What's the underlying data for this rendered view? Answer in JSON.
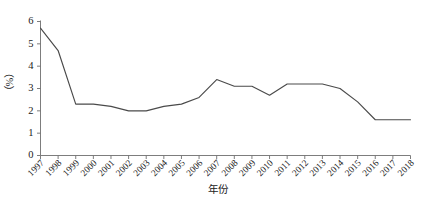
{
  "chart_data": {
    "type": "line",
    "title": "",
    "xlabel": "年份",
    "ylabel": "（%）",
    "categories": [
      "1997",
      "1998",
      "1999",
      "2000",
      "2001",
      "2002",
      "2003",
      "2004",
      "2005",
      "2006",
      "2007",
      "2008",
      "2009",
      "2010",
      "2011",
      "2012",
      "2013",
      "2014",
      "2015",
      "2016",
      "2017",
      "2018"
    ],
    "values": [
      5.7,
      4.7,
      2.3,
      2.3,
      2.2,
      2.0,
      2.0,
      2.2,
      2.3,
      2.6,
      3.4,
      3.1,
      3.1,
      2.7,
      3.2,
      3.2,
      3.2,
      3.0,
      2.4,
      1.6,
      1.6,
      1.6
    ],
    "x": [
      1997,
      1998,
      1999,
      2000,
      2001,
      2002,
      2003,
      2004,
      2005,
      2006,
      2007,
      2008,
      2009,
      2010,
      2011,
      2012,
      2013,
      2014,
      2015,
      2016,
      2017,
      2018
    ],
    "ylim": [
      0,
      6
    ],
    "yticks": [
      0,
      1,
      2,
      3,
      4,
      5,
      6
    ],
    "ytick_labels": [
      "0",
      "1",
      "2",
      "3",
      "4",
      "5",
      "6"
    ],
    "xlim": [
      1997,
      2018
    ],
    "grid": false,
    "legend": null,
    "legend_position": "none",
    "series": [
      {
        "name": "",
        "values": [
          5.7,
          4.7,
          2.3,
          2.3,
          2.2,
          2.0,
          2.0,
          2.2,
          2.3,
          2.6,
          3.4,
          3.1,
          3.1,
          2.7,
          3.2,
          3.2,
          3.2,
          3.0,
          2.4,
          1.6,
          1.6,
          1.6
        ]
      }
    ],
    "line_color": "#4a4a4a",
    "axis_color": "#6e6e6e",
    "background_color": "#ffffff"
  }
}
